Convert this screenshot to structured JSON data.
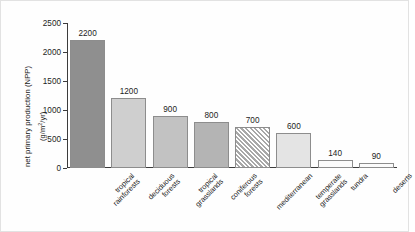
{
  "chart_data": {
    "type": "bar",
    "title": "",
    "xlabel": "",
    "ylabel": "net primary production (NPP)",
    "ylabel_units": "(g/m2/yr)",
    "ylim": [
      0,
      2500
    ],
    "yticks": [
      0,
      500,
      1000,
      1500,
      2000,
      2500
    ],
    "ytick_labels": [
      "0",
      "500",
      "1000",
      "1500",
      "2000",
      "2500"
    ],
    "grid": false,
    "legend": "none",
    "categories": [
      "tropical rainforests",
      "deciduous forests",
      "tropical grasslands",
      "coniferous forests",
      "mediterranean",
      "temperate grasslands",
      "tundra",
      "deserts"
    ],
    "category_lines": [
      [
        "tropical",
        "rainforests"
      ],
      [
        "deciduous",
        "forests"
      ],
      [
        "tropical",
        "grasslands"
      ],
      [
        "coniferous",
        "forests"
      ],
      [
        "mediterranean",
        ""
      ],
      [
        "temperate",
        "grasslands"
      ],
      [
        "tundra",
        ""
      ],
      [
        "deserts",
        ""
      ]
    ],
    "values": [
      2200,
      1200,
      900,
      800,
      700,
      600,
      140,
      90
    ],
    "value_labels": [
      "2200",
      "1200",
      "900",
      "800",
      "700",
      "600",
      "140",
      "90"
    ],
    "bar_fills": [
      "#8f8f8f",
      "#cfcfcf",
      "#c2c2c2",
      "#b4b4b4",
      "hatch",
      "#e4e4e4",
      "#fbfbfb",
      "#fbfbfb"
    ],
    "bar_border": "#8d8d8d",
    "hatch_color": "#a8a8a8"
  }
}
